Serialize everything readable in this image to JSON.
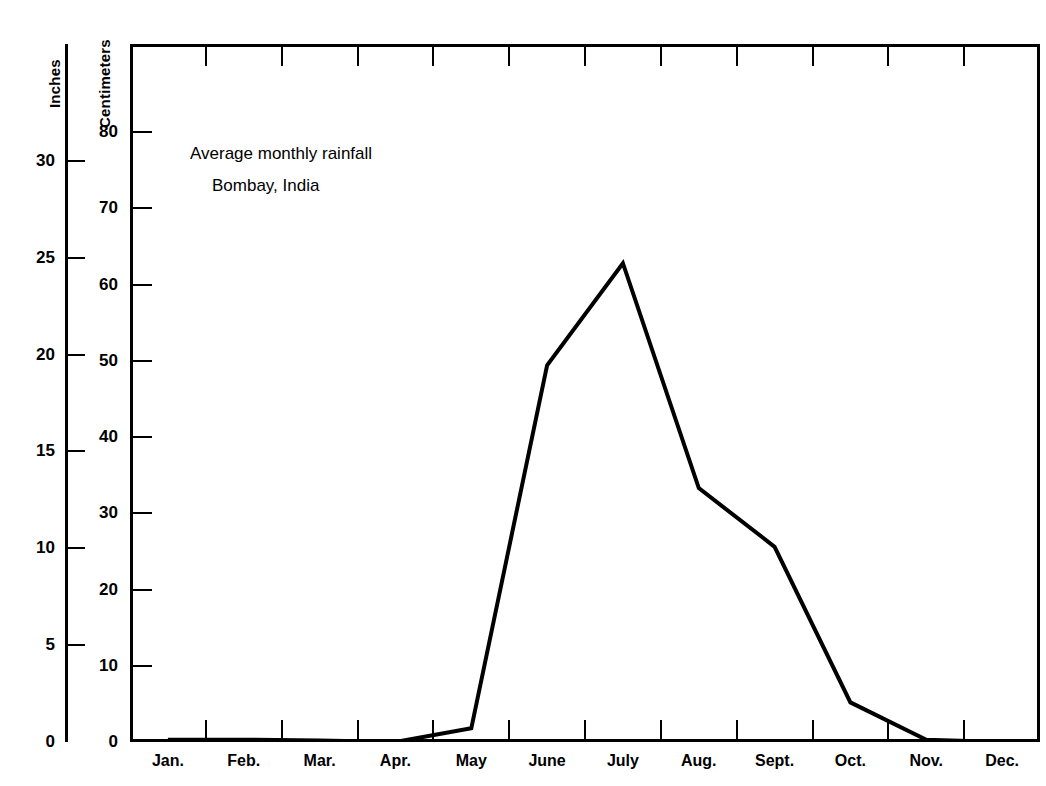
{
  "chart_data": {
    "type": "line",
    "title": "Average monthly rainfall",
    "subtitle": "Bombay, India",
    "categories": [
      "Jan.",
      "Feb.",
      "Mar.",
      "Apr.",
      "May",
      "June",
      "July",
      "Aug.",
      "Sept.",
      "Oct.",
      "Nov.",
      "Dec."
    ],
    "values": [
      0.3,
      0.3,
      0.2,
      0.0,
      1.8,
      49.4,
      62.8,
      33.3,
      25.6,
      5.2,
      0.3,
      0.0
    ],
    "xlabel": "",
    "ylabel": "Centimeters",
    "ylabel_secondary": "Inches",
    "ylim": [
      0,
      91.4
    ],
    "yticks": [
      0,
      10,
      20,
      30,
      40,
      50,
      60,
      70,
      80
    ],
    "ytick_labels": [
      "0",
      "10",
      "20",
      "30",
      "40",
      "50",
      "60",
      "70",
      "80"
    ],
    "yticks_secondary": [
      0,
      5,
      10,
      15,
      20,
      25,
      30
    ],
    "ytick_labels_secondary": [
      "0",
      "5",
      "10",
      "15",
      "20",
      "25",
      "30"
    ],
    "grid": false,
    "legend": null,
    "line_color": "#000000",
    "line_width": 4
  },
  "axes": {
    "inches_title": "Inches",
    "centimeters_title": "Centimeters"
  },
  "annotations": {
    "title_line1": "Average monthly rainfall",
    "title_line2": "Bombay, India"
  }
}
